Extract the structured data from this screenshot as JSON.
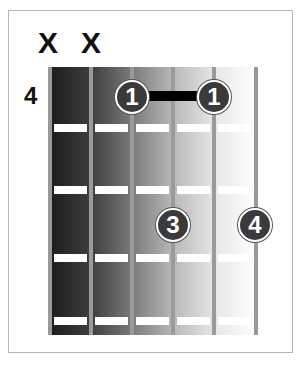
{
  "chord_diagram": {
    "base_fret_label": "4",
    "mute_marks": [
      {
        "string": 6,
        "symbol": "X",
        "x": 48
      },
      {
        "string": 5,
        "symbol": "X",
        "x": 91
      }
    ],
    "strings_x": [
      50,
      91,
      132,
      173,
      214,
      256
    ],
    "frets_y": [
      128,
      190,
      258,
      321
    ],
    "column_shades": [
      "#1c1c1c",
      "#3e3e3e",
      "#7a7a7a",
      "#b8b8b8",
      "#e6e6e6"
    ],
    "fingers": [
      {
        "label": "1",
        "string": 4,
        "fret": 1,
        "x": 132,
        "y": 97
      },
      {
        "label": "1",
        "string": 2,
        "fret": 1,
        "x": 214,
        "y": 97
      },
      {
        "label": "3",
        "string": 3,
        "fret": 3,
        "x": 173,
        "y": 225
      },
      {
        "label": "4",
        "string": 1,
        "fret": 3,
        "x": 255,
        "y": 225
      }
    ],
    "barre": {
      "finger": "1",
      "from_string": 4,
      "to_string": 2,
      "x1": 146,
      "x2": 200,
      "y": 96
    }
  }
}
